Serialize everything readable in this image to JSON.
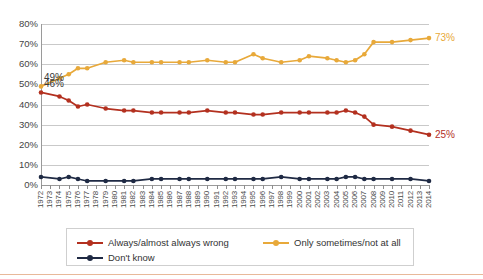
{
  "chart_data": {
    "type": "line",
    "title": "",
    "subtitle": "",
    "xlabel": "",
    "ylabel": "",
    "ylim": [
      0,
      80
    ],
    "ytick_labels": [
      "0%",
      "10%",
      "20%",
      "30%",
      "40%",
      "50%",
      "60%",
      "70%",
      "80%"
    ],
    "ytick_values": [
      0,
      10,
      20,
      30,
      40,
      50,
      60,
      70,
      80
    ],
    "grid": true,
    "legend_position": "bottom",
    "x": [
      1972,
      1973,
      1974,
      1975,
      1976,
      1977,
      1978,
      1979,
      1980,
      1981,
      1982,
      1983,
      1984,
      1985,
      1986,
      1987,
      1988,
      1989,
      1990,
      1991,
      1992,
      1993,
      1994,
      1995,
      1996,
      1997,
      1998,
      1999,
      2000,
      2001,
      2002,
      2003,
      2004,
      2005,
      2006,
      2007,
      2008,
      2009,
      2010,
      2011,
      2012,
      2013,
      2014
    ],
    "categories": [
      "1972",
      "1973",
      "1974",
      "1975",
      "1976",
      "1977",
      "1978",
      "1979",
      "1980",
      "1981",
      "1982",
      "1983",
      "1984",
      "1985",
      "1986",
      "1987",
      "1988",
      "1989",
      "1990",
      "1991",
      "1992",
      "1993",
      "1994",
      "1995",
      "1996",
      "1997",
      "1998",
      "1999",
      "2000",
      "2001",
      "2002",
      "2003",
      "2004",
      "2005",
      "2006",
      "2007",
      "2008",
      "2009",
      "2010",
      "2011",
      "2012",
      "2013",
      "2014"
    ],
    "series": [
      {
        "name": "Always/almost always wrong",
        "color": "#b3301f",
        "values": [
          46,
          null,
          44,
          42,
          39,
          40,
          null,
          38,
          null,
          37,
          37,
          null,
          36,
          36,
          null,
          36,
          36,
          null,
          37,
          null,
          36,
          36,
          null,
          35,
          35,
          null,
          36,
          null,
          36,
          36,
          null,
          36,
          36,
          37,
          36,
          34,
          30,
          null,
          29,
          null,
          27,
          null,
          25
        ],
        "end_label": "25%",
        "start_label": "46%"
      },
      {
        "name": "Only sometimes/not at all",
        "color": "#e8a93a",
        "values": [
          49,
          null,
          53,
          55,
          58,
          58,
          null,
          61,
          null,
          62,
          61,
          null,
          61,
          61,
          null,
          61,
          61,
          null,
          62,
          null,
          61,
          61,
          null,
          65,
          63,
          null,
          61,
          null,
          62,
          64,
          null,
          63,
          62,
          61,
          62,
          65,
          71,
          null,
          71,
          null,
          72,
          null,
          73
        ],
        "end_label": "73%",
        "start_label": "49%"
      },
      {
        "name": "Don't know",
        "color": "#1f2a44",
        "values": [
          4,
          null,
          3,
          4,
          3,
          2,
          null,
          2,
          null,
          2,
          2,
          null,
          3,
          3,
          null,
          3,
          3,
          null,
          3,
          null,
          3,
          3,
          null,
          3,
          3,
          null,
          4,
          null,
          3,
          3,
          null,
          3,
          3,
          4,
          4,
          3,
          3,
          null,
          3,
          null,
          3,
          null,
          2
        ],
        "end_label": "",
        "start_label": ""
      }
    ],
    "annotations": [
      {
        "text": "49%",
        "series": "Only sometimes/not at all",
        "x": 1972,
        "y": 49,
        "position": "left"
      },
      {
        "text": "46%",
        "series": "Always/almost always wrong",
        "x": 1972,
        "y": 46,
        "position": "left"
      },
      {
        "text": "73%",
        "series": "Only sometimes/not at all",
        "x": 2014,
        "y": 73,
        "position": "right"
      },
      {
        "text": "25%",
        "series": "Always/almost always wrong",
        "x": 2014,
        "y": 25,
        "position": "right"
      }
    ],
    "legend": [
      {
        "label": "Always/almost always wrong",
        "color": "#b3301f"
      },
      {
        "label": "Only sometimes/not at all",
        "color": "#e8a93a"
      },
      {
        "label": "Don't know",
        "color": "#1f2a44"
      }
    ]
  }
}
